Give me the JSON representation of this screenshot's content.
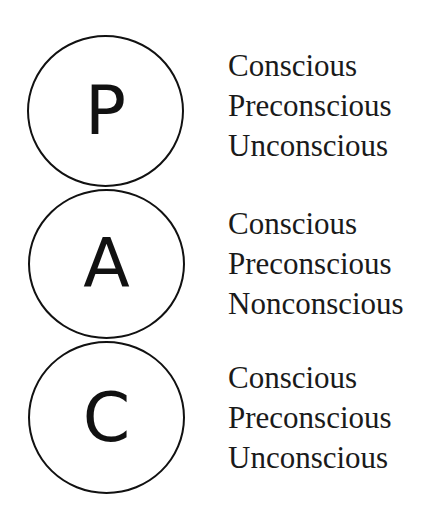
{
  "diagram": {
    "states": [
      {
        "letter": "P",
        "levels": [
          "Conscious",
          "Preconscious",
          "Unconscious"
        ]
      },
      {
        "letter": "A",
        "levels": [
          "Conscious",
          "Preconscious",
          "Nonconscious"
        ]
      },
      {
        "letter": "C",
        "levels": [
          "Conscious",
          "Preconscious",
          "Unconscious"
        ]
      }
    ]
  }
}
